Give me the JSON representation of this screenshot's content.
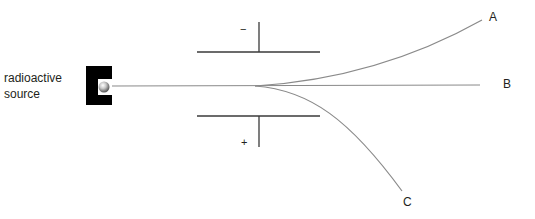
{
  "source": {
    "label_line1": "radioactive",
    "label_line2": "source"
  },
  "plates": {
    "top_sign": "−",
    "bottom_sign": "+"
  },
  "beams": [
    {
      "label": "A",
      "description": "deflected toward negative plate"
    },
    {
      "label": "B",
      "description": "undeflected"
    },
    {
      "label": "C",
      "description": "deflected toward positive plate"
    }
  ],
  "colors": {
    "beam": "#8a8a8a",
    "plate": "#3a3a3a",
    "source_block": "#000000",
    "text": "#231f20"
  }
}
